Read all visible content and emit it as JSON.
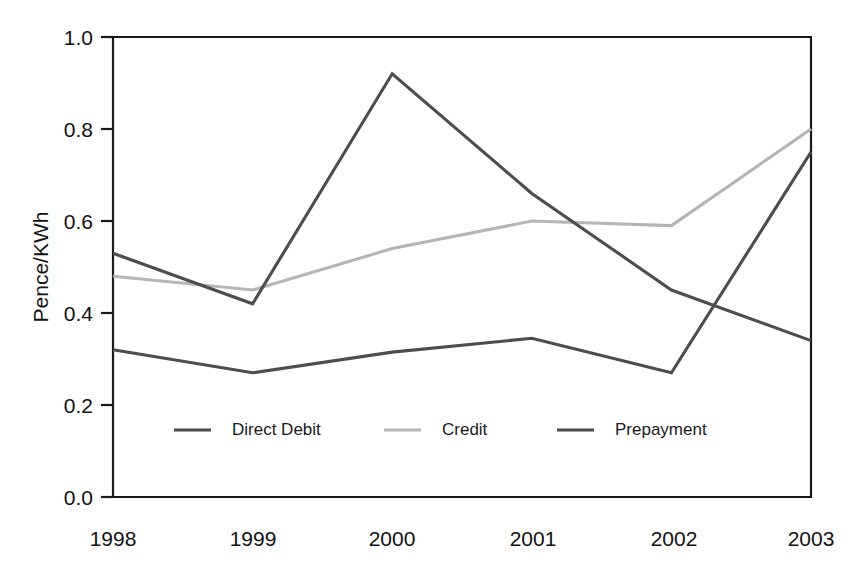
{
  "chart_data": {
    "type": "line",
    "title": "",
    "subtitle": "",
    "xlabel": "",
    "ylabel": "Pence/KWh",
    "categories": [
      "1998",
      "1999",
      "2000",
      "2001",
      "2002",
      "2003"
    ],
    "x": [
      1998,
      1999,
      2000,
      2001,
      2002,
      2003
    ],
    "xlim": [
      1998,
      2003
    ],
    "ylim": [
      0.0,
      1.0
    ],
    "y_ticks": [
      "0.0",
      "0.2",
      "0.4",
      "0.6",
      "0.8",
      "1.0"
    ],
    "y_tick_values": [
      0.0,
      0.2,
      0.4,
      0.6,
      0.8,
      1.0
    ],
    "x_ticks": [
      "1998",
      "1999",
      "2000",
      "2001",
      "2002",
      "2003"
    ],
    "grid": false,
    "legend_position": "inside-bottom-center",
    "series": [
      {
        "name": "Direct Debit",
        "color": "#4d4d4d",
        "values": [
          0.53,
          0.42,
          0.92,
          0.66,
          0.45,
          0.34
        ]
      },
      {
        "name": "Credit",
        "color": "#b5b5b5",
        "values": [
          0.48,
          0.45,
          0.54,
          0.6,
          0.59,
          0.8
        ]
      },
      {
        "name": "Prepayment",
        "color": "#4d4d4d",
        "values": [
          0.32,
          0.27,
          0.315,
          0.345,
          0.27,
          0.75
        ]
      }
    ]
  },
  "axis": {
    "y_title": "Pence/KWh",
    "y_tick_0": "0.0",
    "y_tick_1": "0.2",
    "y_tick_2": "0.4",
    "y_tick_3": "0.6",
    "y_tick_4": "0.8",
    "y_tick_5": "1.0",
    "x_tick_0": "1998",
    "x_tick_1": "1999",
    "x_tick_2": "2000",
    "x_tick_3": "2001",
    "x_tick_4": "2002",
    "x_tick_5": "2003"
  },
  "legend": {
    "entries": [
      {
        "label": "Direct Debit",
        "color": "#4d4d4d"
      },
      {
        "label": "Credit",
        "color": "#b5b5b5"
      },
      {
        "label": "Prepayment",
        "color": "#4d4d4d"
      }
    ]
  },
  "colors": {
    "axis": "#1a1a1a",
    "text": "#111111",
    "background": "#ffffff",
    "series_dark": "#4d4d4d",
    "series_light": "#b5b5b5"
  }
}
